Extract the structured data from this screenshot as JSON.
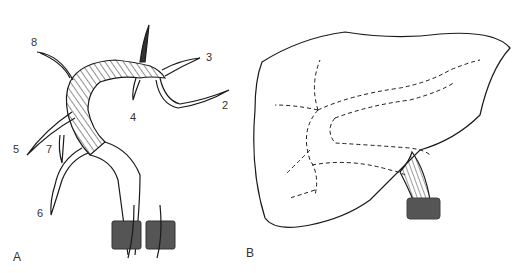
{
  "figure": {
    "panels": [
      {
        "id": "A",
        "label": "A",
        "description": "Aortic arch with branching vessels, hatched graft segment, two clamps at distal ends",
        "vessel_labels": [
          "8",
          "3",
          "2",
          "4",
          "5",
          "7",
          "6"
        ]
      },
      {
        "id": "B",
        "label": "B",
        "description": "Liver outline with dashed internal vascular branches and hatched vessel exiting with clamp"
      }
    ],
    "colors": {
      "line": "#1a1a1a",
      "clamp": "#555555",
      "background": "#ffffff"
    }
  }
}
